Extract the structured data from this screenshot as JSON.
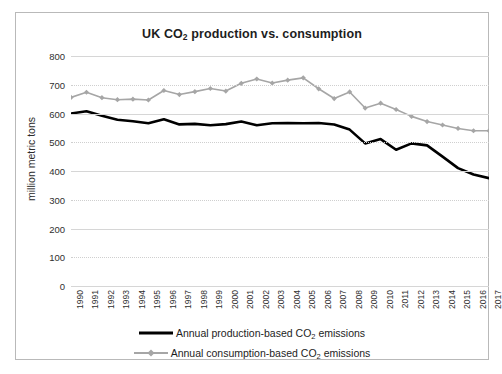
{
  "chart_data": {
    "type": "line",
    "title": "UK CO2 production vs. consumption",
    "title_parts": {
      "pre": "UK CO",
      "sub": "2",
      "post": " production vs. consumption"
    },
    "xlabel": "",
    "ylabel": "million metric tons",
    "ylim": [
      0,
      800
    ],
    "ytick_step": 100,
    "yticks": [
      "0",
      "100",
      "200",
      "300",
      "400",
      "500",
      "600",
      "700",
      "800"
    ],
    "grid": true,
    "legend_position": "bottom",
    "categories": [
      "1990",
      "1991",
      "1992",
      "1993",
      "1994",
      "1995",
      "1996",
      "1997",
      "1998",
      "1999",
      "2000",
      "2001",
      "2002",
      "2003",
      "2004",
      "2005",
      "2006",
      "2007",
      "2008",
      "2009",
      "2010",
      "2011",
      "2012",
      "2013",
      "2014",
      "2015",
      "2016",
      "2017"
    ],
    "series": [
      {
        "name": "Annual production-based CO2 emissions",
        "name_parts": {
          "pre": "Annual production-based CO",
          "sub": "2",
          "post": " emissions"
        },
        "color": "#000000",
        "marker": "none",
        "width": 2.6,
        "values": [
          600,
          608,
          592,
          578,
          573,
          566,
          580,
          562,
          564,
          559,
          563,
          572,
          559,
          566,
          567,
          566,
          567,
          562,
          544,
          496,
          511,
          474,
          496,
          489,
          450,
          410,
          388,
          375
        ]
      },
      {
        "name": "Annual consumption-based CO2 emissions",
        "name_parts": {
          "pre": "Annual consumption-based CO",
          "sub": "2",
          "post": " emissions"
        },
        "color": "#a6a6a6",
        "marker": "diamond",
        "width": 1.6,
        "values": [
          656,
          674,
          655,
          648,
          650,
          647,
          680,
          666,
          676,
          687,
          678,
          705,
          720,
          706,
          716,
          724,
          686,
          652,
          675,
          619,
          636,
          614,
          590,
          572,
          560,
          548,
          540,
          540
        ]
      }
    ]
  }
}
